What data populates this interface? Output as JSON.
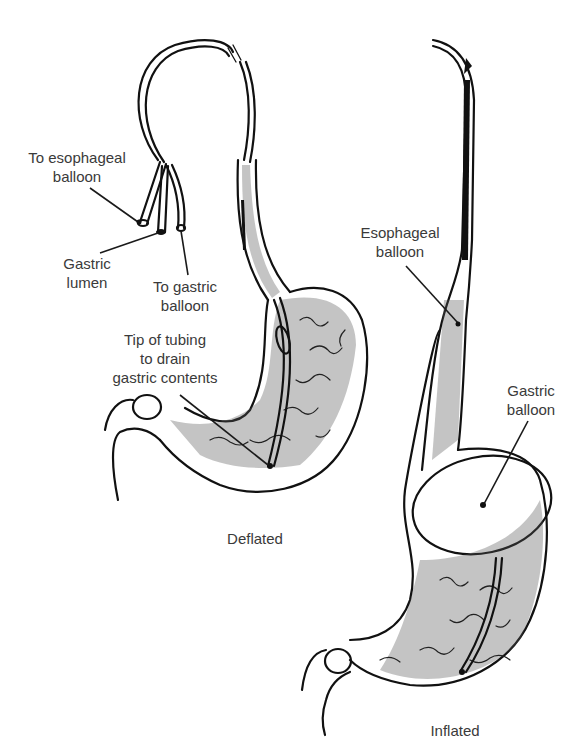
{
  "figure": {
    "panels": [
      {
        "id": "deflated",
        "caption": "Deflated"
      },
      {
        "id": "inflated",
        "caption": "Inflated"
      }
    ],
    "labels": {
      "to_esophageal_balloon": [
        "To esophageal",
        "balloon"
      ],
      "gastric_lumen": [
        "Gastric",
        "lumen"
      ],
      "to_gastric_balloon": [
        "To gastric",
        "balloon"
      ],
      "tip_of_tubing": [
        "Tip of tubing",
        "to drain",
        "gastric contents"
      ],
      "esophageal_balloon": [
        "Esophageal",
        "balloon"
      ],
      "gastric_balloon": [
        "Gastric",
        "balloon"
      ]
    },
    "colors": {
      "background": "#ffffff",
      "ink": "#111111",
      "label_text": "#3a3a3a"
    }
  }
}
